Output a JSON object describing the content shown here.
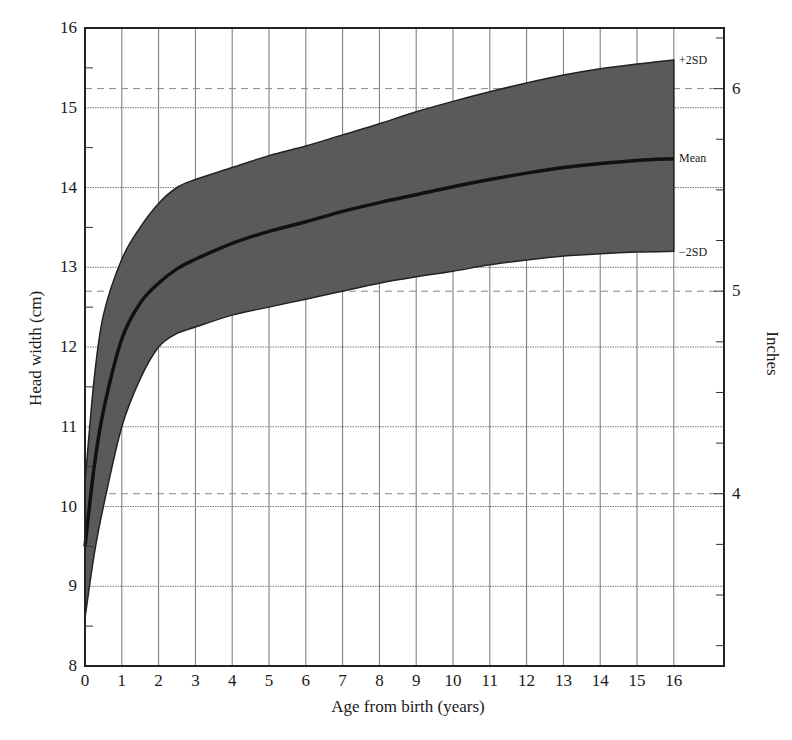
{
  "chart_data": {
    "type": "area",
    "title": "",
    "xlabel": "Age from birth (years)",
    "ylabel": "Head width (cm)",
    "y2label": "Inches",
    "xlim": [
      0,
      16
    ],
    "ylim": [
      8,
      16
    ],
    "y2lim_inches": [
      3.15,
      6.3
    ],
    "grid": true,
    "x_ticks": [
      0,
      1,
      2,
      3,
      4,
      5,
      6,
      7,
      8,
      9,
      10,
      11,
      12,
      13,
      14,
      15,
      16
    ],
    "y_ticks": [
      8,
      9,
      10,
      11,
      12,
      13,
      14,
      15,
      16
    ],
    "y2_ticks": [
      4,
      5,
      6
    ],
    "x": [
      0,
      0.25,
      0.5,
      1,
      1.5,
      2,
      2.5,
      3,
      4,
      5,
      6,
      7,
      8,
      9,
      10,
      11,
      12,
      13,
      14,
      15,
      16
    ],
    "series": [
      {
        "name": "+2SD",
        "values": [
          10.3,
          11.6,
          12.4,
          13.1,
          13.5,
          13.8,
          14.0,
          14.1,
          14.25,
          14.4,
          14.52,
          14.66,
          14.8,
          14.95,
          15.08,
          15.2,
          15.31,
          15.41,
          15.49,
          15.55,
          15.6
        ]
      },
      {
        "name": "Mean",
        "values": [
          9.5,
          10.5,
          11.2,
          12.1,
          12.55,
          12.8,
          12.98,
          13.1,
          13.3,
          13.45,
          13.57,
          13.7,
          13.81,
          13.91,
          14.01,
          14.1,
          14.18,
          14.25,
          14.3,
          14.34,
          14.36
        ]
      },
      {
        "name": "-2SD",
        "values": [
          8.6,
          9.4,
          10.0,
          11.0,
          11.6,
          12.0,
          12.17,
          12.25,
          12.4,
          12.5,
          12.6,
          12.7,
          12.8,
          12.88,
          12.95,
          13.03,
          13.09,
          13.14,
          13.17,
          13.19,
          13.2
        ]
      }
    ],
    "annotations": [
      "+2SD",
      "Mean",
      "−2SD"
    ],
    "reference_lines_inches": [
      4,
      5,
      6
    ]
  },
  "labels": {
    "xlabel": "Age from birth (years)",
    "ylabel": "Head width (cm)",
    "y2label": "Inches",
    "plus2sd": "+2SD",
    "mean": "Mean",
    "minus2sd": "−2SD"
  },
  "style": {
    "band_color": "#5a5a5a",
    "mean_color": "#111111",
    "grid_color": "#777777",
    "axis_color": "#222222"
  }
}
